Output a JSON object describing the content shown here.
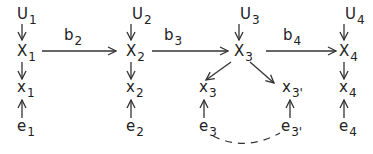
{
  "diagram": {
    "columns": [
      {
        "U": "U",
        "U_sub": "1",
        "X": "X",
        "X_sub": "1",
        "x": "x",
        "x_sub": "1",
        "e": "e",
        "e_sub": "1"
      },
      {
        "U": "U",
        "U_sub": "2",
        "X": "X",
        "X_sub": "2",
        "x": "x",
        "x_sub": "2",
        "e": "e",
        "e_sub": "2"
      },
      {
        "U": "U",
        "U_sub": "3",
        "X": "X",
        "X_sub": "3",
        "x_left": "x",
        "x_left_sub": "3",
        "x_right": "x",
        "x_right_sub": "3'",
        "e_left": "e",
        "e_left_sub": "3",
        "e_right": "e",
        "e_right_sub": "3'"
      },
      {
        "U": "U",
        "U_sub": "4",
        "X": "X",
        "X_sub": "4",
        "x": "x",
        "x_sub": "4",
        "e": "e",
        "e_sub": "4"
      }
    ],
    "edges": [
      {
        "label": "b",
        "label_sub": "2",
        "from": "X1",
        "to": "X2"
      },
      {
        "label": "b",
        "label_sub": "3",
        "from": "X2",
        "to": "X3"
      },
      {
        "label": "b",
        "label_sub": "4",
        "from": "X3",
        "to": "X4"
      }
    ],
    "dashed_link": {
      "from": "e3",
      "to": "e3'"
    }
  }
}
